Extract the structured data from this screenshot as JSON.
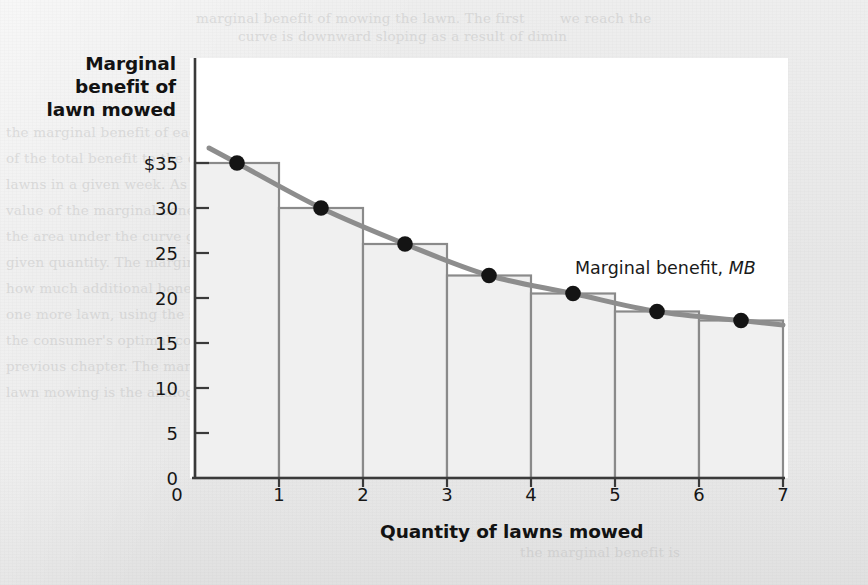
{
  "figure": {
    "y_axis_title_lines": [
      "Marginal",
      "benefit of",
      "lawn mowed"
    ],
    "x_axis_title": "Quantity of lawns mowed",
    "curve_label_text": "Marginal benefit,",
    "curve_label_symbol": "MB"
  },
  "colors": {
    "page_background": "#e9e9e9",
    "plot_background": "#ffffff",
    "bar_fill": "#f0f0f0",
    "bar_stroke": "#8a8a8a",
    "curve": "#8d8d8d",
    "point": "#141414",
    "axis": "#3a3a3a",
    "text": "#141414"
  },
  "ghost_text": [
    {
      "x": 196,
      "y": 6,
      "t": "marginal benefit of mowing the lawn. The first"
    },
    {
      "x": 560,
      "y": 6,
      "t": "we reach the"
    },
    {
      "x": 238,
      "y": 24,
      "t": "curve is downward sloping as a result of dimin"
    },
    {
      "x": 6,
      "y": 120,
      "t": "the marginal benefit of each successive lawn mowed is"
    },
    {
      "x": 6,
      "y": 146,
      "t": "of the total benefit to the consumer from mowing a"
    },
    {
      "x": 6,
      "y": 172,
      "t": "lawns in a given week. As we saw in Section the"
    },
    {
      "x": 6,
      "y": 198,
      "t": "value of the marginal benefit curve up to that quantity"
    },
    {
      "x": 6,
      "y": 224,
      "t": "the area under the curve gives the total benefit of"
    },
    {
      "x": 6,
      "y": 250,
      "t": "given quantity. The marginal benefit schedule shows"
    },
    {
      "x": 6,
      "y": 276,
      "t": "how much additional benefit is gained from mowing"
    },
    {
      "x": 6,
      "y": 302,
      "t": "one more lawn, using the same logic we applied to"
    },
    {
      "x": 6,
      "y": 328,
      "t": "the consumer's optimal consumption bundle in the"
    },
    {
      "x": 6,
      "y": 354,
      "t": "previous chapter. The marginal benefit curve of"
    },
    {
      "x": 6,
      "y": 380,
      "t": "lawn mowing is the analog to the demand curve"
    },
    {
      "x": 520,
      "y": 540,
      "t": "the marginal benefit is"
    }
  ],
  "chart_data": {
    "type": "bar",
    "title": "",
    "xlabel": "Quantity of lawns mowed",
    "ylabel": "Marginal benefit of lawn mowed",
    "xlim": [
      0,
      7
    ],
    "ylim": [
      0,
      40
    ],
    "grid": false,
    "legend": "Marginal benefit, MB",
    "categories": [
      "1",
      "2",
      "3",
      "4",
      "5",
      "6",
      "7"
    ],
    "values": [
      35,
      30,
      26,
      22.5,
      20.5,
      18.5,
      17.5
    ],
    "bar_midpoints": [
      0.5,
      1.5,
      2.5,
      3.5,
      4.5,
      5.5,
      6.5
    ],
    "series": [
      {
        "name": "Marginal benefit, MB",
        "x": [
          0.5,
          1.5,
          2.5,
          3.5,
          4.5,
          5.5,
          6.5
        ],
        "values": [
          35,
          30,
          26,
          22.5,
          20.5,
          18.5,
          17.5
        ],
        "marker": "filled-circle"
      }
    ],
    "y_ticks": [
      {
        "value": 35,
        "label": "$35"
      },
      {
        "value": 30,
        "label": "30"
      },
      {
        "value": 25,
        "label": "25"
      },
      {
        "value": 20,
        "label": "20"
      },
      {
        "value": 15,
        "label": "15"
      },
      {
        "value": 10,
        "label": "10"
      },
      {
        "value": 5,
        "label": "5"
      },
      {
        "value": 0,
        "label": "0"
      }
    ],
    "x_ticks": [
      {
        "value": 0,
        "label": "0"
      },
      {
        "value": 1,
        "label": "1"
      },
      {
        "value": 2,
        "label": "2"
      },
      {
        "value": 3,
        "label": "3"
      },
      {
        "value": 4,
        "label": "4"
      },
      {
        "value": 5,
        "label": "5"
      },
      {
        "value": 6,
        "label": "6"
      },
      {
        "value": 7,
        "label": "7"
      }
    ]
  }
}
